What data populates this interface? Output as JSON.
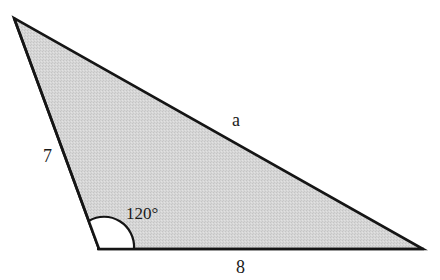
{
  "figure": {
    "type": "triangle",
    "colors": {
      "fill": "#d3d3d3",
      "stroke": "#151515",
      "angle_arc_fill": "#ffffff"
    },
    "vertices": {
      "top_left": [
        14,
        18
      ],
      "bottom_left": [
        99,
        249
      ],
      "bottom_right": [
        423,
        249
      ]
    },
    "sides": {
      "left": {
        "label": "7"
      },
      "bottom": {
        "label": "8"
      },
      "hypotenuse": {
        "label": "a"
      }
    },
    "angle": {
      "label": "120°",
      "vertex": "bottom_left"
    }
  }
}
